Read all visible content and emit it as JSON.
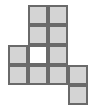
{
  "figure": {
    "name": "polyomino-grid-figure",
    "type": "grid-shape",
    "canvas": {
      "width": 96,
      "height": 110
    },
    "grid": {
      "origin_x": 8,
      "origin_y": 5,
      "cell_size": 20,
      "columns": 4,
      "rows": 5
    },
    "colors": {
      "fill": "#d4d4d4",
      "hole_fill": "#ffffff",
      "stroke": "#6a6a6a",
      "background": "#ffffff"
    },
    "stroke_width": 2,
    "counts": {
      "filled_cells": 9,
      "hole_cells": 1
    },
    "cells": [
      {
        "col": 1,
        "row": 0,
        "state": "filled"
      },
      {
        "col": 2,
        "row": 0,
        "state": "filled"
      },
      {
        "col": 1,
        "row": 1,
        "state": "filled"
      },
      {
        "col": 2,
        "row": 1,
        "state": "filled"
      },
      {
        "col": 0,
        "row": 2,
        "state": "filled"
      },
      {
        "col": 1,
        "row": 2,
        "state": "hole"
      },
      {
        "col": 2,
        "row": 2,
        "state": "filled"
      },
      {
        "col": 0,
        "row": 3,
        "state": "filled"
      },
      {
        "col": 1,
        "row": 3,
        "state": "filled"
      },
      {
        "col": 2,
        "row": 3,
        "state": "filled"
      },
      {
        "col": 3,
        "row": 3,
        "state": "filled"
      },
      {
        "col": 3,
        "row": 4,
        "state": "filled"
      }
    ]
  }
}
